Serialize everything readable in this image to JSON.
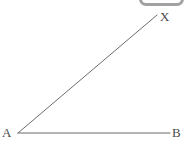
{
  "figure": {
    "background_color": "#ffffff",
    "stroke_color": "#6b6b6b",
    "label_color": "#4a4a4a",
    "stroke_width": 1,
    "width": 188,
    "height": 144,
    "points": {
      "A": {
        "label": "A",
        "x": 18,
        "y": 133
      },
      "B": {
        "label": "B",
        "x": 170,
        "y": 133
      },
      "X": {
        "label": "X",
        "x": 157,
        "y": 15
      }
    },
    "segments": [
      {
        "name": "ray-AB",
        "from": "A",
        "to": "B",
        "x1": 18,
        "y1": 133,
        "x2": 170,
        "y2": 133
      },
      {
        "name": "ray-AX",
        "from": "A",
        "to": "X",
        "x1": 18,
        "y1": 133,
        "x2": 157,
        "y2": 15
      }
    ]
  },
  "overlay": {
    "top_chip": {
      "name": "clipped-chip",
      "border_color": "#9a9a9a",
      "fill_color": "#ffffff"
    }
  }
}
